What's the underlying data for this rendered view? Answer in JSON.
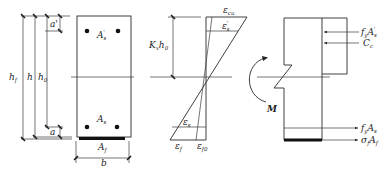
{
  "diagram": {
    "title": "",
    "section": {
      "labels": {
        "hf": "h",
        "hf_sub": "f",
        "h": "h",
        "h0": "h",
        "h0_sub": "0",
        "a_prime": "a'",
        "a": "a",
        "As_prime": "A",
        "As_prime_sub": "s",
        "As_prime_sup": "'",
        "As": "A",
        "As_sub": "s",
        "Af": "A",
        "Af_sub": "f",
        "b": "b"
      }
    },
    "strain": {
      "labels": {
        "kxh0": "K",
        "kxh0_sub": "x",
        "kxh0_tail": "h",
        "kxh0_tail_sub": "0",
        "eps_cu": "ε",
        "eps_cu_sub": "cu",
        "eps_s_prime": "ε",
        "eps_s_prime_sub": "s",
        "eps_s_prime_sup": "'",
        "eps_s": "ε",
        "eps_s_sub": "s",
        "eps_f": "ε",
        "eps_f_sub": "f",
        "eps_f0": "ε",
        "eps_f0_sub": "f0"
      }
    },
    "stress": {
      "labels": {
        "M": "M",
        "fyAs_prime": "f",
        "fyAs_prime_sub": "y",
        "fyAs_prime_A": "A",
        "fyAs_prime_A_sub": "s",
        "fyAs_prime_sup": "'",
        "Cc": "C",
        "Cc_sub": "c",
        "fyAs": "f",
        "fyAs_sub": "y",
        "fyAs_A": "A",
        "fyAs_A_sub": "s",
        "sigmafAf": "σ",
        "sigmafAf_sub": "f",
        "sigmafAf_A": "A",
        "sigmafAf_A_sub": "f"
      }
    }
  }
}
